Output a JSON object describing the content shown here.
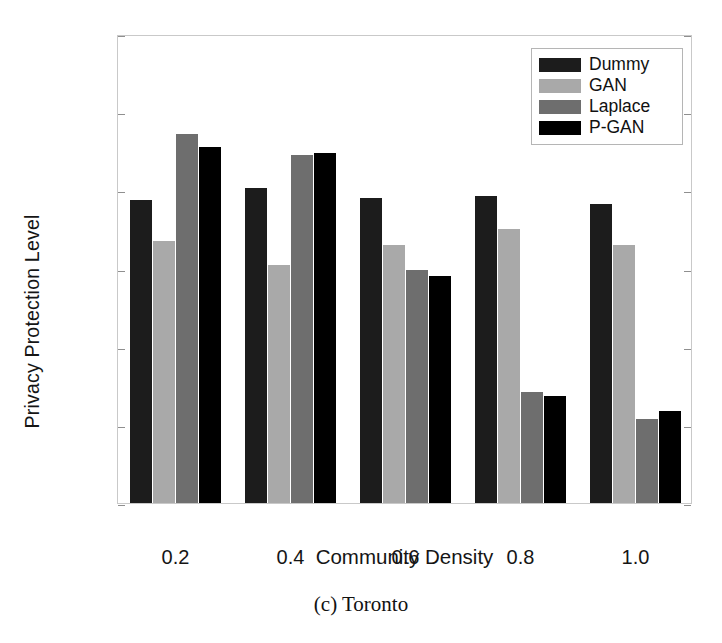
{
  "chart_data": {
    "type": "bar",
    "title": "",
    "caption": "(c) Toronto",
    "xlabel": "Community Density",
    "ylabel": "Privacy Protection Level",
    "categories": [
      "0.2",
      "0.4",
      "0.6",
      "0.8",
      "1.0"
    ],
    "ylim": [
      0,
      1.2
    ],
    "yticks": [
      "0",
      "0.2",
      "0.4",
      "0.6",
      "0.8",
      "1",
      "1.2"
    ],
    "ytick_values": [
      0,
      0.2,
      0.4,
      0.6,
      0.8,
      1,
      1.2
    ],
    "grid": false,
    "legend_position": "top-right",
    "series": [
      {
        "name": "Dummy",
        "color": "#1c1c1c",
        "values": [
          0.775,
          0.805,
          0.78,
          0.785,
          0.765
        ]
      },
      {
        "name": "GAN",
        "color": "#a9a9a9",
        "values": [
          0.67,
          0.61,
          0.66,
          0.7,
          0.66
        ]
      },
      {
        "name": "Laplace",
        "color": "#6e6e6e",
        "values": [
          0.945,
          0.89,
          0.595,
          0.285,
          0.215
        ]
      },
      {
        "name": "P-GAN",
        "color": "#000000",
        "values": [
          0.91,
          0.895,
          0.58,
          0.275,
          0.235
        ]
      }
    ]
  },
  "axis": {
    "frame_color": "#c9c9c9",
    "tick_color": "#8f8f8f"
  }
}
